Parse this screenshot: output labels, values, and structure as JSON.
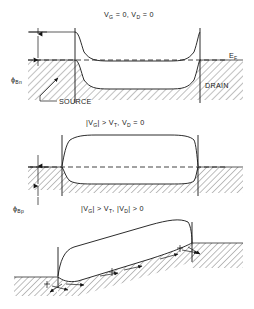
{
  "figure": {
    "width": 254,
    "height": 309,
    "background": "#ffffff",
    "ink_color": "#141414"
  },
  "panels": [
    {
      "id": "panel-top",
      "caption": "V",
      "caption_parts": {
        "v1_symbol": "V",
        "v1_sub": "G",
        "v1_rel": " = 0,  ",
        "v2_symbol": "V",
        "v2_sub": "D",
        "v2_rel": " = 0"
      },
      "caption_plain": "V_G = 0, V_D = 0",
      "condition": "equilibrium",
      "labels": {
        "fermi": "E",
        "fermi_sub": "F",
        "fermi_plain": "E_F",
        "barrier": "ϕ",
        "barrier_sub": "Bn",
        "barrier_plain": "ϕ_Bn",
        "source": "SOURCE",
        "drain": "DRAIN"
      }
    },
    {
      "id": "panel-middle",
      "caption_parts": {
        "bar_open": "|",
        "v1_symbol": "V",
        "v1_sub": "G",
        "bar_close": "|",
        "rel1": " > ",
        "vt_symbol": "V",
        "vt_sub": "T",
        "comma": ",  ",
        "v2_symbol": "V",
        "v2_sub": "D",
        "rel2": " = 0"
      },
      "caption_plain": "|V_G| > V_T, V_D = 0",
      "condition": "inversion, zero drain bias",
      "labels": {
        "barrier": "ϕ",
        "barrier_sub": "Bp",
        "barrier_plain": "ϕ_Bp"
      }
    },
    {
      "id": "panel-bottom",
      "caption_parts": {
        "bar_open": "|",
        "v1_symbol": "V",
        "v1_sub": "G",
        "bar_close": "|",
        "rel1": " > ",
        "vt_symbol": "V",
        "vt_sub": "T",
        "comma": ",  ",
        "bar_open2": "|",
        "v2_symbol": "V",
        "v2_sub": "D",
        "bar_close2": "|",
        "rel2": " > 0"
      },
      "caption_plain": "|V_G| > V_T, |V_D| > 0",
      "condition": "inversion with drain bias, carrier flow shown"
    }
  ]
}
